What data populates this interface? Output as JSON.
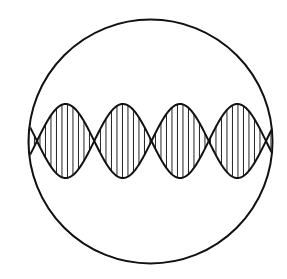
{
  "diagram": {
    "title": "",
    "colors": {
      "background": "#ffffff",
      "stroke": "#111111",
      "hatch": "#222222"
    },
    "circle": {
      "cx": 150.5,
      "cy": 141.5,
      "r": 122
    },
    "wave": {
      "axis_y": 141,
      "nodes_x": [
        37,
        94,
        151.5,
        209,
        266
      ],
      "amplitude": 37,
      "loops": 4,
      "hatch_spacing": 5.5
    }
  }
}
